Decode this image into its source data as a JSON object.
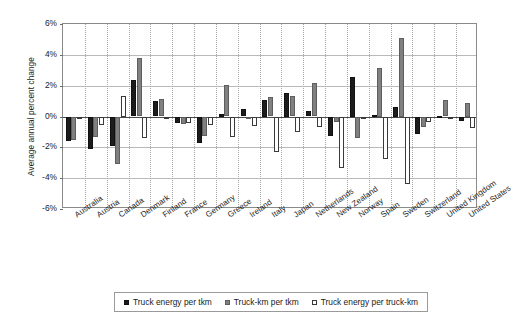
{
  "chart_data": {
    "type": "bar",
    "title": "",
    "xlabel": "",
    "ylabel": "Average annual percent change",
    "ylim": [
      -6,
      6
    ],
    "ytick_labels": [
      "6%",
      "4%",
      "2%",
      "0%",
      "-2%",
      "-4%",
      "-6%"
    ],
    "ytick_values": [
      6,
      4,
      2,
      0,
      -2,
      -4,
      -6
    ],
    "grid": true,
    "legend_position": "bottom",
    "categories": [
      "Australia",
      "Austria",
      "Canada",
      "Denmark",
      "Finland",
      "France",
      "Germany",
      "Greece",
      "Ireland",
      "Italy",
      "Japan",
      "Netherlands",
      "New Zealand",
      "Norway",
      "Spain",
      "Sweden",
      "Switzerland",
      "United Kingdom",
      "United States"
    ],
    "series": [
      {
        "name": "Truck energy per tkm",
        "color": "#1c1c1c",
        "values": [
          -1.6,
          -2.1,
          -1.9,
          2.35,
          1.0,
          -0.45,
          -1.7,
          0.15,
          0.5,
          1.05,
          1.5,
          0.35,
          -1.25,
          2.55,
          0.1,
          0.6,
          -1.15,
          0.05,
          -0.3
        ]
      },
      {
        "name": "Truck-km per tkm",
        "color": "#808080",
        "values": [
          -1.55,
          -1.35,
          -3.1,
          3.8,
          1.15,
          -0.5,
          -1.25,
          2.05,
          -0.1,
          1.25,
          1.3,
          2.2,
          -0.35,
          -1.4,
          3.15,
          5.1,
          -0.65,
          1.1,
          0.9
        ]
      },
      {
        "name": "Truck energy per truck-km",
        "color": "#ffffff",
        "values": [
          -0.1,
          -0.55,
          1.35,
          -1.4,
          0.0,
          -0.4,
          -0.55,
          -1.35,
          -0.6,
          -2.3,
          -1.0,
          -0.7,
          -3.35,
          -0.15,
          -2.75,
          -4.35,
          -0.35,
          0.0,
          -0.75
        ]
      }
    ]
  },
  "legend": {
    "items": [
      {
        "label": "Truck energy per tkm",
        "swatch": "filled-black-square-icon"
      },
      {
        "label": "Truck-km per tkm",
        "swatch": "filled-gray-square-icon"
      },
      {
        "label": "Truck energy per truck-km",
        "swatch": "open-square-icon"
      }
    ]
  }
}
